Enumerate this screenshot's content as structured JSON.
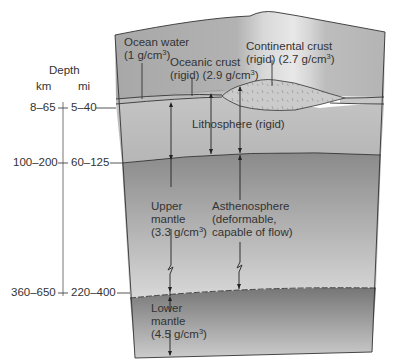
{
  "depth_scale": {
    "title": "Depth",
    "units": {
      "km": "km",
      "mi": "mi"
    },
    "markers": [
      {
        "km": "8–65",
        "mi": "5–40"
      },
      {
        "km": "100–200",
        "mi": "60–125"
      },
      {
        "km": "360–650",
        "mi": "220–400"
      }
    ]
  },
  "layers": {
    "ocean_water": {
      "name": "Ocean water",
      "density_prefix": "(1 g/cm",
      "density_suffix": ")"
    },
    "oceanic_crust": {
      "name": "Oceanic crust",
      "density_prefix": "(rigid) (2.9 g/cm",
      "density_suffix": ")"
    },
    "continental_crust": {
      "name": "Continental crust",
      "density_prefix": "(rigid) (2.7 g/cm",
      "density_suffix": ")"
    },
    "lithosphere": {
      "name": "Lithosphere (rigid)"
    },
    "upper_mantle": {
      "line1": "Upper",
      "line2": "mantle",
      "density_prefix": "(3.3 g/cm",
      "density_suffix": ")"
    },
    "asthenosphere": {
      "line1": "Asthenosphere",
      "line2": "(deformable,",
      "line3": "capable of flow)"
    },
    "lower_mantle": {
      "line1": "Lower",
      "line2": "mantle",
      "density_prefix": "(4.5 g/cm",
      "density_suffix": ")"
    }
  },
  "superscript": "3",
  "colors": {
    "ocean_surface": "#a9a9a9",
    "lithosphere": "#bcbcbc",
    "asthenosphere_top": "#8e8e8e",
    "asthenosphere_bottom": "#d4d4d4",
    "lower_mantle_top": "#7a7a7a",
    "lower_mantle_bottom": "#c8c8c8",
    "continental_crust": "#c9c9c9",
    "outline": "#333333"
  }
}
